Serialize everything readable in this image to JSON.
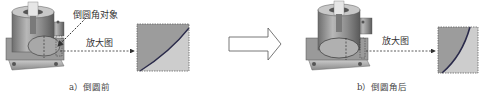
{
  "panel_a": {
    "callout_label": "倒圆角对象",
    "zoom_label": "放大图",
    "caption": "a）倒圆前"
  },
  "panel_b": {
    "zoom_label": "放大图",
    "caption": "b）倒圆角后"
  },
  "colors": {
    "part_body": "#8c8c8c",
    "part_light": "#cfcfcf",
    "zoom_fill_dark": "#9a9a9a",
    "zoom_fill_light": "#cdcdcd",
    "edge_curve": "#2a2a4a",
    "arrow_stroke": "#555555"
  }
}
